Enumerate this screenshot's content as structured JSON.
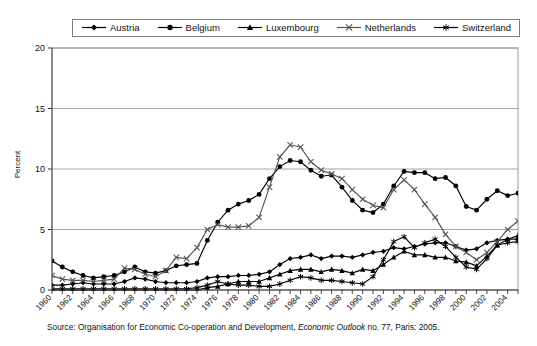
{
  "figure": {
    "source_note_prefix": "Source: Organisation for Economic Co-operation and Development, ",
    "source_note_italic": "Economic Outlook",
    "source_note_suffix": " no. 77, Paris: 2005.",
    "axis_label_y": "Percent"
  },
  "legend": {
    "items": [
      {
        "label": "Austria",
        "marker": "diamond",
        "color": "#000000"
      },
      {
        "label": "Belgium",
        "marker": "circle",
        "color": "#000000"
      },
      {
        "label": "Luxembourg",
        "marker": "triangle",
        "color": "#000000"
      },
      {
        "label": "Netherlands",
        "marker": "x",
        "color": "#555555"
      },
      {
        "label": "Switzerland",
        "marker": "star",
        "color": "#000000"
      }
    ]
  },
  "chart_data": {
    "type": "line",
    "title": "",
    "xlabel": "",
    "ylabel": "Percent",
    "ylim": [
      0,
      20
    ],
    "yticks": [
      0,
      5,
      10,
      15,
      20
    ],
    "ytick_labels": [
      "0",
      "5",
      "10",
      "15",
      "20"
    ],
    "xlim": [
      1960,
      2005
    ],
    "grid": "horizontal",
    "legend_position": "top",
    "x": [
      1960,
      1961,
      1962,
      1963,
      1964,
      1965,
      1966,
      1967,
      1968,
      1969,
      1970,
      1971,
      1972,
      1973,
      1974,
      1975,
      1976,
      1977,
      1978,
      1979,
      1980,
      1981,
      1982,
      1983,
      1984,
      1985,
      1986,
      1987,
      1988,
      1989,
      1990,
      1991,
      1992,
      1993,
      1994,
      1995,
      1996,
      1997,
      1998,
      1999,
      2000,
      2001,
      2002,
      2003,
      2004,
      2005
    ],
    "xtick_labels": [
      "1960",
      "1962",
      "1964",
      "1966",
      "1968",
      "1970",
      "1972",
      "1974",
      "1976",
      "1978",
      "1980",
      "1982",
      "1984",
      "1986",
      "1988",
      "1990",
      "1992",
      "1994",
      "1996",
      "1998",
      "2000",
      "2002",
      "2004"
    ],
    "series": [
      {
        "name": "Austria",
        "marker": "diamond",
        "color": "#000000",
        "values": [
          0.4,
          0.4,
          0.5,
          0.6,
          0.5,
          0.5,
          0.5,
          0.7,
          1.0,
          0.9,
          0.7,
          0.6,
          0.6,
          0.6,
          0.7,
          1.0,
          1.1,
          1.1,
          1.2,
          1.2,
          1.3,
          1.5,
          2.1,
          2.6,
          2.7,
          2.9,
          2.6,
          2.8,
          2.8,
          2.7,
          2.9,
          3.1,
          3.2,
          3.5,
          3.4,
          3.6,
          3.8,
          3.9,
          3.9,
          3.6,
          3.3,
          3.4,
          3.9,
          4.1,
          4.2,
          4.2
        ]
      },
      {
        "name": "Belgium",
        "marker": "circle",
        "color": "#000000",
        "values": [
          2.4,
          1.9,
          1.5,
          1.2,
          1.0,
          1.1,
          1.2,
          1.5,
          1.9,
          1.5,
          1.4,
          1.6,
          2.0,
          2.1,
          2.2,
          4.1,
          5.6,
          6.6,
          7.1,
          7.4,
          7.9,
          9.2,
          10.2,
          10.7,
          10.6,
          9.9,
          9.4,
          9.5,
          8.5,
          7.4,
          6.6,
          6.4,
          7.1,
          8.6,
          9.8,
          9.7,
          9.7,
          9.2,
          9.3,
          8.6,
          6.9,
          6.6,
          7.5,
          8.2,
          7.8,
          8.0
        ]
      },
      {
        "name": "Luxembourg",
        "marker": "triangle",
        "color": "#000000",
        "values": [
          0.0,
          0.0,
          0.0,
          0.0,
          0.0,
          0.0,
          0.0,
          0.0,
          0.0,
          0.0,
          0.0,
          0.0,
          0.0,
          0.0,
          0.0,
          0.2,
          0.3,
          0.5,
          0.7,
          0.7,
          0.7,
          1.0,
          1.3,
          1.6,
          1.7,
          1.7,
          1.5,
          1.7,
          1.6,
          1.4,
          1.7,
          1.6,
          2.1,
          2.7,
          3.2,
          2.9,
          2.9,
          2.7,
          2.7,
          2.4,
          2.3,
          2.0,
          2.8,
          3.7,
          4.2,
          4.5
        ]
      },
      {
        "name": "Netherlands",
        "marker": "x",
        "color": "#555555",
        "values": [
          1.2,
          0.9,
          0.8,
          0.8,
          0.7,
          0.8,
          0.9,
          1.8,
          1.7,
          1.3,
          1.1,
          1.6,
          2.7,
          2.6,
          3.5,
          5.0,
          5.4,
          5.2,
          5.2,
          5.3,
          6.0,
          8.5,
          11.0,
          12.0,
          11.8,
          10.6,
          9.9,
          9.6,
          9.2,
          8.3,
          7.5,
          7.0,
          6.8,
          8.3,
          9.1,
          8.3,
          7.1,
          6.0,
          4.6,
          3.6,
          3.1,
          2.5,
          3.1,
          4.0,
          5.0,
          5.7
        ]
      },
      {
        "name": "Switzerland",
        "marker": "star",
        "color": "#000000",
        "values": [
          0.1,
          0.1,
          0.1,
          0.1,
          0.1,
          0.1,
          0.1,
          0.1,
          0.1,
          0.1,
          0.1,
          0.1,
          0.1,
          0.1,
          0.2,
          0.4,
          0.7,
          0.5,
          0.4,
          0.4,
          0.3,
          0.3,
          0.5,
          0.8,
          1.1,
          1.0,
          0.8,
          0.8,
          0.7,
          0.6,
          0.5,
          1.1,
          2.5,
          4.0,
          4.4,
          3.5,
          3.9,
          4.2,
          3.6,
          2.7,
          1.9,
          1.7,
          2.6,
          3.7,
          3.9,
          4.0
        ]
      }
    ]
  }
}
